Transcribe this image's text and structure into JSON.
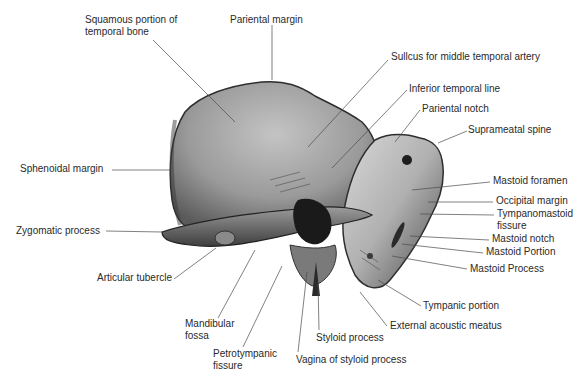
{
  "figure": {
    "colors": {
      "bone_light": "#c9c9c9",
      "bone_mid": "#8f8f8f",
      "bone_dark": "#3a3a3a",
      "line": "#4a4a4a",
      "text": "#2a2a2a"
    }
  },
  "labels": [
    {
      "id": "squamous",
      "text": "Squamous portion of\ntemporal bone",
      "x": 85,
      "y": 20
    },
    {
      "id": "pariental-margin",
      "text": "Pariental margin",
      "x": 230,
      "y": 15
    },
    {
      "id": "sulcus",
      "text": "Sullcus for middle temporal artery",
      "x": 391,
      "y": 51
    },
    {
      "id": "inferior-temporal-line",
      "text": "Inferior temporal line",
      "x": 409,
      "y": 83
    },
    {
      "id": "pariental-notch",
      "text": "Pariental notch",
      "x": 422,
      "y": 103
    },
    {
      "id": "suprameatal-spine",
      "text": "Suprameatal spine",
      "x": 468,
      "y": 124
    },
    {
      "id": "sphenoidal-margin",
      "text": "Sphenoidal margin",
      "x": 20,
      "y": 163
    },
    {
      "id": "mastoid-foramen",
      "text": "Mastoid foramen",
      "x": 493,
      "y": 175
    },
    {
      "id": "occipital-margin",
      "text": "Occipital margin",
      "x": 496,
      "y": 195
    },
    {
      "id": "tympanomastoid",
      "text": "Tympanomastoid\nfissure",
      "x": 497,
      "y": 208
    },
    {
      "id": "zygomatic",
      "text": "Zygomatic process",
      "x": 16,
      "y": 225
    },
    {
      "id": "mastoid-notch",
      "text": "Mastoid notch",
      "x": 492,
      "y": 233
    },
    {
      "id": "mastoid-portion",
      "text": "Mastoid Portion",
      "x": 486,
      "y": 246
    },
    {
      "id": "mastoid-process",
      "text": "Mastoid Process",
      "x": 470,
      "y": 263
    },
    {
      "id": "articular-tubercle",
      "text": "Articular tubercle",
      "x": 97,
      "y": 272
    },
    {
      "id": "tympanic-portion",
      "text": "Tympanic portion",
      "x": 423,
      "y": 300
    },
    {
      "id": "mandibular-fossa",
      "text": "Mandibular\nfossa",
      "x": 185,
      "y": 318
    },
    {
      "id": "external-acoustic",
      "text": "External acoustic meatus",
      "x": 390,
      "y": 320
    },
    {
      "id": "styloid",
      "text": "Styloid process",
      "x": 316,
      "y": 332
    },
    {
      "id": "petrotympanic",
      "text": "Petrotympanic\nfissure",
      "x": 213,
      "y": 348
    },
    {
      "id": "vagina-styloid",
      "text": "Vagina of styloid process",
      "x": 296,
      "y": 354
    }
  ]
}
